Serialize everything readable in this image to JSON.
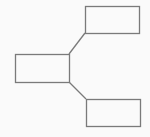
{
  "diagram": {
    "background": "#fafafa",
    "stroke": "#7a7a7a",
    "stroke_width": 1.3,
    "nodes": [
      {
        "id": "left-box",
        "x": 15,
        "y": 54,
        "w": 54,
        "h": 28,
        "label": ""
      },
      {
        "id": "top-right-box",
        "x": 85,
        "y": 6,
        "w": 54,
        "h": 27,
        "label": ""
      },
      {
        "id": "bottom-right-box",
        "x": 86,
        "y": 99,
        "w": 54,
        "h": 27,
        "label": ""
      }
    ],
    "edges": [
      {
        "from": "left-box",
        "to": "top-right-box",
        "x1": 69,
        "y1": 54,
        "x2": 85,
        "y2": 33
      },
      {
        "from": "left-box",
        "to": "bottom-right-box",
        "x1": 69,
        "y1": 82,
        "x2": 86,
        "y2": 99
      }
    ]
  }
}
